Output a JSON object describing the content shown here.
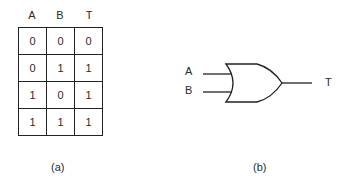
{
  "truth_table": {
    "headers": [
      "A",
      "B",
      "T"
    ],
    "rows": [
      [
        "0",
        "0",
        "0"
      ],
      [
        "0",
        "1",
        "1"
      ],
      [
        "1",
        "0",
        "1"
      ],
      [
        "1",
        "1",
        "1"
      ]
    ],
    "caption": "(a)"
  },
  "gate": {
    "type": "OR",
    "inputs": [
      "A",
      "B"
    ],
    "output": "T",
    "caption": "(b)"
  }
}
